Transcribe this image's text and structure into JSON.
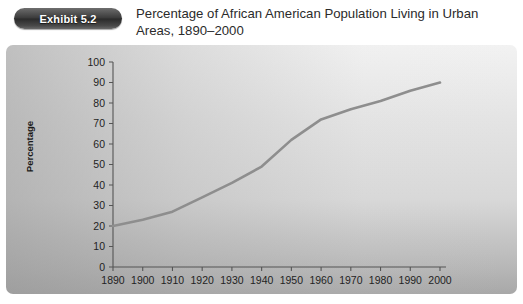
{
  "header": {
    "badge_label": "Exhibit 5.2",
    "title": "Percentage of African American Population Living in Urban Areas, 1890–2000"
  },
  "chart_data": {
    "type": "line",
    "title": "Percentage of African American Population Living in Urban Areas, 1890–2000",
    "xlabel": "",
    "ylabel": "Percentage",
    "categories": [
      "1890",
      "1900",
      "1910",
      "1920",
      "1930",
      "1940",
      "1950",
      "1960",
      "1970",
      "1980",
      "1990",
      "2000"
    ],
    "x": [
      1890,
      1900,
      1910,
      1920,
      1930,
      1940,
      1950,
      1960,
      1970,
      1980,
      1990,
      2000
    ],
    "values": [
      20,
      23,
      27,
      34,
      41,
      49,
      62,
      72,
      77,
      81,
      86,
      90
    ],
    "ylim": [
      0,
      100
    ],
    "ytick_values": [
      0,
      10,
      20,
      30,
      40,
      50,
      60,
      70,
      80,
      90,
      100
    ],
    "ytick_labels": [
      "0",
      "10",
      "20",
      "30",
      "40",
      "50",
      "60",
      "70",
      "80",
      "90",
      "100"
    ],
    "xlim": [
      1890,
      2000
    ],
    "grid": false,
    "legend": false,
    "series_color": "#8e8e8e"
  },
  "colors": {
    "panel_light": "#f2f2f2",
    "panel_dark": "#a8a8a8",
    "line": "#8e8e8e",
    "axis": "#555555",
    "badge_text": "#ffffff",
    "title_text": "#2b2b2b"
  }
}
